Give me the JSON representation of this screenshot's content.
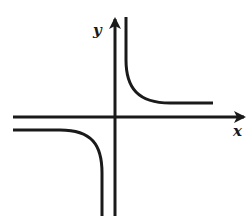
{
  "diagram": {
    "type": "function-graph",
    "axes": {
      "x_label": "x",
      "y_label": "y"
    },
    "curves": [
      {
        "name": "upper-right-branch",
        "quadrant": "I"
      },
      {
        "name": "lower-left-branch",
        "quadrant": "III"
      }
    ],
    "colors": {
      "stroke": "#1a1a1a",
      "background": "#ffffff"
    }
  }
}
